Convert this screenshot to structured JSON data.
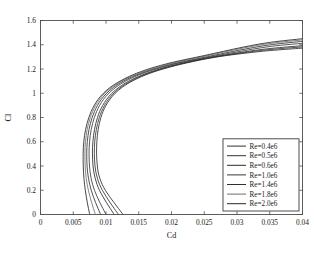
{
  "chart_data": {
    "type": "line",
    "title": "",
    "xlabel": "Cd",
    "ylabel": "Cl",
    "xlim": [
      0,
      0.04
    ],
    "ylim": [
      0,
      1.6
    ],
    "xticks": [
      0,
      0.005,
      0.01,
      0.015,
      0.02,
      0.025,
      0.03,
      0.035,
      0.04
    ],
    "xtick_labels": [
      "0",
      "0.005",
      "0.01",
      "0.015",
      "0.02",
      "0.025",
      "0.03",
      "0.035",
      "0.04"
    ],
    "yticks": [
      0,
      0.2,
      0.4,
      0.6,
      0.8,
      1.0,
      1.2,
      1.4,
      1.6
    ],
    "ytick_labels": [
      "0",
      "0.2",
      "0.4",
      "0.6",
      "0.8",
      "1",
      "1.2",
      "1.4",
      "1.6"
    ],
    "grid": false,
    "legend_position": "lower right",
    "series": [
      {
        "name": "Re=0.4e6",
        "color": "#2f2f2f",
        "points": [
          [
            0.0126,
            0.0
          ],
          [
            0.0119,
            0.05
          ],
          [
            0.0112,
            0.1
          ],
          [
            0.0105,
            0.15
          ],
          [
            0.0099,
            0.2
          ],
          [
            0.0094,
            0.25
          ],
          [
            0.00905,
            0.3
          ],
          [
            0.0088,
            0.35
          ],
          [
            0.00868,
            0.4
          ],
          [
            0.0086,
            0.45
          ],
          [
            0.00856,
            0.5
          ],
          [
            0.00856,
            0.55
          ],
          [
            0.0086,
            0.6
          ],
          [
            0.00868,
            0.65
          ],
          [
            0.0088,
            0.7
          ],
          [
            0.00898,
            0.75
          ],
          [
            0.00922,
            0.8
          ],
          [
            0.00955,
            0.85
          ],
          [
            0.01,
            0.9
          ],
          [
            0.0106,
            0.95
          ],
          [
            0.0114,
            1.0
          ],
          [
            0.0125,
            1.05
          ],
          [
            0.014,
            1.1
          ],
          [
            0.016,
            1.15
          ],
          [
            0.0187,
            1.2
          ],
          [
            0.0223,
            1.25
          ],
          [
            0.027,
            1.3
          ],
          [
            0.0328,
            1.34
          ],
          [
            0.0364,
            1.358
          ],
          [
            0.04,
            1.372
          ]
        ]
      },
      {
        "name": "Re=0.5e6",
        "color": "#343434",
        "points": [
          [
            0.0119,
            0.0
          ],
          [
            0.01125,
            0.05
          ],
          [
            0.0106,
            0.1
          ],
          [
            0.01,
            0.15
          ],
          [
            0.00945,
            0.2
          ],
          [
            0.009,
            0.25
          ],
          [
            0.00868,
            0.3
          ],
          [
            0.00845,
            0.35
          ],
          [
            0.00832,
            0.4
          ],
          [
            0.00825,
            0.45
          ],
          [
            0.00822,
            0.5
          ],
          [
            0.00823,
            0.55
          ],
          [
            0.00828,
            0.6
          ],
          [
            0.00838,
            0.65
          ],
          [
            0.00852,
            0.7
          ],
          [
            0.00872,
            0.75
          ],
          [
            0.00898,
            0.8
          ],
          [
            0.00932,
            0.85
          ],
          [
            0.00978,
            0.9
          ],
          [
            0.01038,
            0.95
          ],
          [
            0.01118,
            1.0
          ],
          [
            0.01228,
            1.05
          ],
          [
            0.01378,
            1.1
          ],
          [
            0.01578,
            1.15
          ],
          [
            0.01848,
            1.2
          ],
          [
            0.02205,
            1.25
          ],
          [
            0.02672,
            1.3
          ],
          [
            0.0325,
            1.345
          ],
          [
            0.0362,
            1.366
          ],
          [
            0.04,
            1.382
          ]
        ]
      },
      {
        "name": "Re=0.6e6",
        "color": "#2b2b2b",
        "points": [
          [
            0.01125,
            0.0
          ],
          [
            0.01065,
            0.05
          ],
          [
            0.01005,
            0.1
          ],
          [
            0.0095,
            0.15
          ],
          [
            0.009,
            0.2
          ],
          [
            0.00862,
            0.25
          ],
          [
            0.00834,
            0.3
          ],
          [
            0.00814,
            0.35
          ],
          [
            0.00802,
            0.4
          ],
          [
            0.00796,
            0.45
          ],
          [
            0.00793,
            0.5
          ],
          [
            0.00794,
            0.55
          ],
          [
            0.008,
            0.6
          ],
          [
            0.0081,
            0.65
          ],
          [
            0.00824,
            0.7
          ],
          [
            0.00844,
            0.75
          ],
          [
            0.0087,
            0.8
          ],
          [
            0.00904,
            0.85
          ],
          [
            0.0095,
            0.9
          ],
          [
            0.0101,
            0.95
          ],
          [
            0.0109,
            1.0
          ],
          [
            0.012,
            1.05
          ],
          [
            0.0135,
            1.1
          ],
          [
            0.0155,
            1.15
          ],
          [
            0.0182,
            1.2
          ],
          [
            0.02178,
            1.25
          ],
          [
            0.02645,
            1.3
          ],
          [
            0.03225,
            1.35
          ],
          [
            0.036,
            1.374
          ],
          [
            0.04,
            1.392
          ]
        ]
      },
      {
        "name": "Re=1.0e6",
        "color": "#3a3a3a",
        "points": [
          [
            0.01,
            0.0
          ],
          [
            0.00952,
            0.05
          ],
          [
            0.00905,
            0.1
          ],
          [
            0.00862,
            0.15
          ],
          [
            0.00824,
            0.2
          ],
          [
            0.00794,
            0.25
          ],
          [
            0.00772,
            0.3
          ],
          [
            0.00757,
            0.35
          ],
          [
            0.00748,
            0.4
          ],
          [
            0.00743,
            0.45
          ],
          [
            0.00741,
            0.5
          ],
          [
            0.00743,
            0.55
          ],
          [
            0.00749,
            0.6
          ],
          [
            0.00759,
            0.65
          ],
          [
            0.00774,
            0.7
          ],
          [
            0.00795,
            0.75
          ],
          [
            0.00822,
            0.8
          ],
          [
            0.00857,
            0.85
          ],
          [
            0.00903,
            0.9
          ],
          [
            0.00963,
            0.95
          ],
          [
            0.01043,
            1.0
          ],
          [
            0.01152,
            1.05
          ],
          [
            0.013,
            1.1
          ],
          [
            0.01498,
            1.15
          ],
          [
            0.01765,
            1.2
          ],
          [
            0.02122,
            1.25
          ],
          [
            0.02592,
            1.3
          ],
          [
            0.0318,
            1.358
          ],
          [
            0.0357,
            1.39
          ],
          [
            0.04,
            1.412
          ]
        ]
      },
      {
        "name": "Re=1.4e6",
        "color": "#303030",
        "points": [
          [
            0.00918,
            0.0
          ],
          [
            0.00878,
            0.05
          ],
          [
            0.0084,
            0.1
          ],
          [
            0.00805,
            0.15
          ],
          [
            0.00775,
            0.2
          ],
          [
            0.0075,
            0.25
          ],
          [
            0.00732,
            0.3
          ],
          [
            0.00719,
            0.35
          ],
          [
            0.00711,
            0.4
          ],
          [
            0.00707,
            0.45
          ],
          [
            0.00706,
            0.5
          ],
          [
            0.00708,
            0.55
          ],
          [
            0.00714,
            0.6
          ],
          [
            0.00725,
            0.65
          ],
          [
            0.0074,
            0.7
          ],
          [
            0.00761,
            0.75
          ],
          [
            0.00789,
            0.8
          ],
          [
            0.00824,
            0.85
          ],
          [
            0.0087,
            0.9
          ],
          [
            0.0093,
            0.95
          ],
          [
            0.0101,
            1.0
          ],
          [
            0.01118,
            1.05
          ],
          [
            0.01265,
            1.1
          ],
          [
            0.01462,
            1.15
          ],
          [
            0.01726,
            1.2
          ],
          [
            0.0208,
            1.25
          ],
          [
            0.02548,
            1.302
          ],
          [
            0.0314,
            1.366
          ],
          [
            0.03545,
            1.402
          ],
          [
            0.04,
            1.428
          ]
        ]
      },
      {
        "name": "Re=1.8e6",
        "color": "#6e6e6e",
        "points": [
          [
            0.00838,
            0.0
          ],
          [
            0.00808,
            0.05
          ],
          [
            0.0078,
            0.1
          ],
          [
            0.00754,
            0.15
          ],
          [
            0.00731,
            0.2
          ],
          [
            0.00712,
            0.25
          ],
          [
            0.00698,
            0.3
          ],
          [
            0.00688,
            0.35
          ],
          [
            0.00682,
            0.4
          ],
          [
            0.00679,
            0.45
          ],
          [
            0.00678,
            0.5
          ],
          [
            0.0068,
            0.55
          ],
          [
            0.00686,
            0.6
          ],
          [
            0.00697,
            0.65
          ],
          [
            0.00712,
            0.7
          ],
          [
            0.00733,
            0.75
          ],
          [
            0.00761,
            0.8
          ],
          [
            0.00796,
            0.85
          ],
          [
            0.00842,
            0.9
          ],
          [
            0.00902,
            0.95
          ],
          [
            0.00982,
            1.0
          ],
          [
            0.0109,
            1.05
          ],
          [
            0.01236,
            1.1
          ],
          [
            0.01432,
            1.15
          ],
          [
            0.01695,
            1.2
          ],
          [
            0.02048,
            1.252
          ],
          [
            0.02515,
            1.306
          ],
          [
            0.0311,
            1.374
          ],
          [
            0.03525,
            1.412
          ],
          [
            0.04,
            1.44
          ]
        ]
      },
      {
        "name": "Re=2.0e6",
        "color": "#262626",
        "points": [
          [
            0.00752,
            0.0
          ],
          [
            0.00732,
            0.05
          ],
          [
            0.00714,
            0.1
          ],
          [
            0.00698,
            0.15
          ],
          [
            0.00684,
            0.2
          ],
          [
            0.00672,
            0.25
          ],
          [
            0.00663,
            0.3
          ],
          [
            0.00657,
            0.35
          ],
          [
            0.00653,
            0.4
          ],
          [
            0.00651,
            0.45
          ],
          [
            0.00651,
            0.5
          ],
          [
            0.00654,
            0.55
          ],
          [
            0.00661,
            0.6
          ],
          [
            0.00672,
            0.65
          ],
          [
            0.00688,
            0.7
          ],
          [
            0.0071,
            0.75
          ],
          [
            0.00738,
            0.8
          ],
          [
            0.00774,
            0.85
          ],
          [
            0.0082,
            0.9
          ],
          [
            0.0088,
            0.95
          ],
          [
            0.0096,
            1.0
          ],
          [
            0.01068,
            1.05
          ],
          [
            0.01214,
            1.1
          ],
          [
            0.0141,
            1.152
          ],
          [
            0.01672,
            1.204
          ],
          [
            0.02025,
            1.256
          ],
          [
            0.02492,
            1.31
          ],
          [
            0.0309,
            1.38
          ],
          [
            0.0351,
            1.42
          ],
          [
            0.04,
            1.45
          ]
        ]
      }
    ]
  }
}
